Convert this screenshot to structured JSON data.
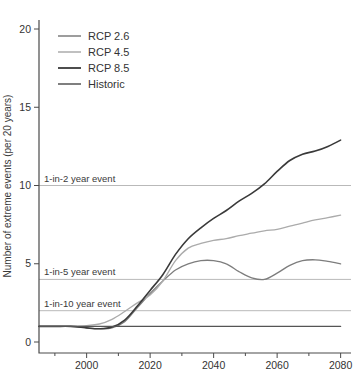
{
  "chart_data": {
    "type": "line",
    "title": "",
    "xlabel": "",
    "ylabel": "Number of extreme events (per 20 years)",
    "xlim": [
      1985,
      2084
    ],
    "ylim": [
      0,
      20
    ],
    "grid": false,
    "legend_position": "top-left-inside",
    "y_ticks": [
      0,
      5,
      10,
      15,
      20
    ],
    "x_ticks_major": [
      2000,
      2020,
      2040,
      2060,
      2080
    ],
    "x_ticks_minor": [
      1990,
      2010,
      2030,
      2050,
      2070
    ],
    "reference_lines": [
      {
        "label": "1-in-2 year event",
        "y": 10
      },
      {
        "label": "1-in-5 year event",
        "y": 4
      },
      {
        "label": "1-in-10 year event",
        "y": 2
      }
    ],
    "x": [
      1985,
      1990,
      1995,
      2000,
      2004,
      2008,
      2012,
      2016,
      2020,
      2024,
      2028,
      2032,
      2036,
      2040,
      2044,
      2048,
      2052,
      2056,
      2060,
      2064,
      2068,
      2072,
      2076,
      2080
    ],
    "series": [
      {
        "name": "RCP 2.6",
        "color": "#7d7d7d",
        "width": 1.3,
        "values": [
          1.0,
          1.0,
          1.0,
          0.9,
          0.85,
          0.9,
          1.3,
          2.2,
          3.1,
          3.9,
          4.6,
          5.0,
          5.2,
          5.2,
          5.0,
          4.5,
          4.1,
          4.0,
          4.4,
          4.9,
          5.2,
          5.25,
          5.15,
          5.0
        ]
      },
      {
        "name": "RCP 4.5",
        "color": "#ababab",
        "width": 1.3,
        "values": [
          1.0,
          1.0,
          1.0,
          1.05,
          1.15,
          1.45,
          1.95,
          2.5,
          3.0,
          3.9,
          5.2,
          6.0,
          6.3,
          6.5,
          6.6,
          6.8,
          6.95,
          7.1,
          7.2,
          7.4,
          7.6,
          7.8,
          7.95,
          8.1
        ]
      },
      {
        "name": "RCP 8.5",
        "color": "#3a3a3a",
        "width": 1.6,
        "values": [
          1.0,
          1.0,
          1.0,
          0.9,
          0.85,
          0.95,
          1.4,
          2.3,
          3.3,
          4.3,
          5.6,
          6.6,
          7.3,
          7.9,
          8.4,
          9.0,
          9.5,
          10.1,
          10.9,
          11.6,
          12.0,
          12.2,
          12.5,
          12.9
        ]
      },
      {
        "name": "Historic",
        "color": "#555555",
        "width": 1.3,
        "values": [
          1.0,
          1.0,
          1.0,
          1.0,
          1.0,
          1.0,
          1.0,
          1.0,
          1.0,
          1.0,
          1.0,
          1.0,
          1.0,
          1.0,
          1.0,
          1.0,
          1.0,
          1.0,
          1.0,
          1.0,
          1.0,
          1.0,
          1.0,
          1.0
        ]
      }
    ],
    "colors": {
      "axis": "#4a4a4a",
      "tick_label": "#333333",
      "reference_line": "#b9b9b9",
      "annotation_text": "#3a3a3a",
      "legend_text": "#333333",
      "background": "#ffffff"
    }
  }
}
